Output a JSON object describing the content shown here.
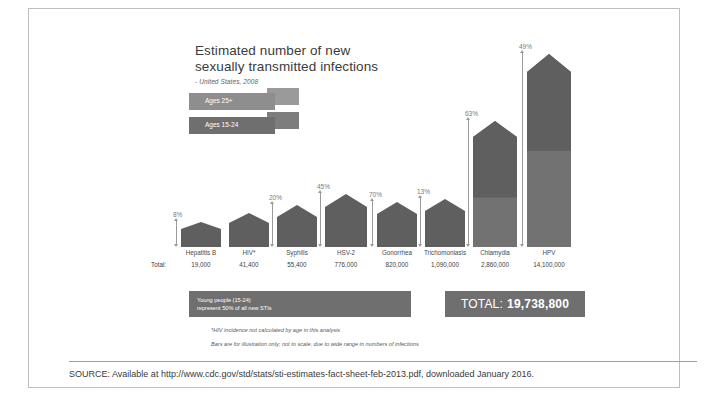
{
  "top_caption": "",
  "infographic": {
    "title_line1": "Estimated number of new",
    "title_line2": "sexually transmitted infections",
    "subtitle": "- United States, 2008",
    "legend": [
      {
        "label": "Ages 25+",
        "color": "#8e8e8e"
      },
      {
        "label": "Ages 15-24",
        "color": "#6f6f6f"
      }
    ],
    "total_caption": "Total:",
    "young_people_line1": "Young people (15-24)",
    "young_people_line2": "represent 50% of all new STIs",
    "total_box_label": "TOTAL:",
    "total_box_value": "19,738,800",
    "footnote1": "*HIV incidence not calculated by age in this analysis",
    "footnote2": "Bars are for illustration only; not to scale, due to wide range in numbers of infections"
  },
  "source": {
    "text": "SOURCE: Available at http://www.cdc.gov/std/stats/sti-estimates-fact-sheet-feb-2013.pdf, downloaded January 2016."
  },
  "chart_data": {
    "type": "bar",
    "title": "Estimated number of new sexually transmitted infections",
    "subtitle": "- United States, 2008",
    "xlabel": "",
    "ylabel": "Number of new infections",
    "note": "Bars are for illustration only; not to scale, due to wide range in numbers of infections",
    "legend": [
      "Ages 25+",
      "Ages 15-24"
    ],
    "categories": [
      "Hepatitis B",
      "HIV*",
      "Syphilis",
      "HSV-2",
      "Gonorrhea",
      "Trichomoniasis",
      "Chlamydia",
      "HPV"
    ],
    "totals": [
      "19,000",
      "41,400",
      "55,400",
      "776,000",
      "820,000",
      "1,090,000",
      "2,860,000",
      "14,100,000"
    ],
    "totals_numeric": [
      19000,
      41400,
      55400,
      776000,
      820000,
      1090000,
      2860000,
      14100000
    ],
    "pct_youth_labels": [
      "8%",
      "20%",
      "45%",
      "70%",
      "13%",
      "63%",
      "49%"
    ],
    "series": [
      {
        "name": "Percent ages 15-24",
        "values": [
          8,
          null,
          20,
          45,
          70,
          13,
          63,
          49
        ]
      }
    ],
    "grand_total": "19,738,800"
  },
  "bars": [
    {
      "label": "Hepatitis B",
      "total": "19,000",
      "pct": "8%",
      "height": 18,
      "split": 0.0,
      "peak": 7,
      "x": 0,
      "w": 40
    },
    {
      "label": "HIV*",
      "total": "41,400",
      "pct": "",
      "height": 24,
      "split": 0.0,
      "peak": 10,
      "x": 48,
      "w": 40
    },
    {
      "label": "Syphilis",
      "total": "55,400",
      "pct": "20%",
      "height": 30,
      "split": 0.0,
      "peak": 12,
      "x": 96,
      "w": 40
    },
    {
      "label": "HSV-2",
      "total": "776,000",
      "pct": "45%",
      "height": 40,
      "split": 0.0,
      "peak": 13,
      "x": 144,
      "w": 42
    },
    {
      "label": "Gonorrhea",
      "total": "820,000",
      "pct": "70%",
      "height": 33,
      "split": 0.0,
      "peak": 12,
      "x": 196,
      "w": 40
    },
    {
      "label": "Trichomoniasis",
      "total": "1,090,000",
      "pct": "13%",
      "height": 36,
      "split": 0.0,
      "peak": 12,
      "x": 244,
      "w": 40
    },
    {
      "label": "Chlamydia",
      "total": "2,860,000",
      "pct": "63%",
      "height": 110,
      "split": 0.45,
      "peak": 16,
      "x": 292,
      "w": 44
    },
    {
      "label": "HPV",
      "total": "14,100,000",
      "pct": "49%",
      "height": 175,
      "split": 0.55,
      "peak": 18,
      "x": 346,
      "w": 44
    }
  ]
}
